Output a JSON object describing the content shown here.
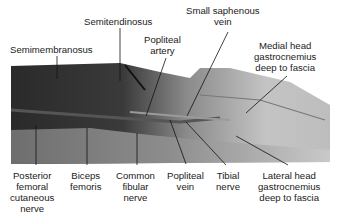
{
  "figure": {
    "labels": [
      {
        "id": "semitendinosus",
        "text": "Semitendinosus"
      },
      {
        "id": "semimembranosus",
        "text": "Semimembranosus"
      },
      {
        "id": "popliteal-artery",
        "line1": "Popliteal",
        "line2": "artery"
      },
      {
        "id": "small-saphenous-vein",
        "line1": "Small saphenous",
        "line2": "vein"
      },
      {
        "id": "medial-head-gastrocnemius",
        "line1": "Medial head",
        "line2": "gastrocnemius",
        "line3": "deep to fascia"
      },
      {
        "id": "posterior-femoral-cutaneous-nerve",
        "line1": "Posterior",
        "line2": "femoral",
        "line3": "cutaneous",
        "line4": "nerve"
      },
      {
        "id": "biceps-femoris",
        "line1": "Biceps",
        "line2": "femoris"
      },
      {
        "id": "common-fibular-nerve",
        "line1": "Common",
        "line2": "fibular",
        "line3": "nerve"
      },
      {
        "id": "popliteal-vein",
        "line1": "Popliteal",
        "line2": "vein"
      },
      {
        "id": "tibial-nerve",
        "line1": "Tibial",
        "line2": "nerve"
      },
      {
        "id": "lateral-head-gastrocnemius",
        "line1": "Lateral head",
        "line2": "gastrocnemius",
        "line3": "deep to fascia"
      }
    ]
  }
}
